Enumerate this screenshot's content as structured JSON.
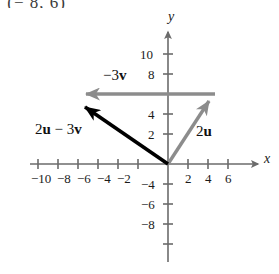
{
  "figure": {
    "cropped_text_above": " (− 8, 6)",
    "axes": {
      "x_axis_label": "x",
      "y_axis_label": "y",
      "x_ticks": [
        -10,
        -8,
        -6,
        -4,
        -2,
        2,
        4,
        6
      ],
      "x_tick_labels": [
        "−10",
        "−8",
        "−6",
        "−4",
        "−2",
        "2",
        "4",
        "6"
      ],
      "y_ticks": [
        10,
        8,
        4,
        2,
        -4,
        -6,
        -8
      ],
      "y_tick_labels": [
        "10",
        "8",
        "4",
        "2",
        "−4",
        "−6",
        "−8"
      ],
      "origin_px": [
        168,
        164
      ],
      "unit_px": 10,
      "xlim": [
        -11.5,
        8.5
      ],
      "ylim": [
        -9.5,
        11.5
      ]
    },
    "vectors": [
      {
        "name": "2u",
        "label": "2u",
        "label_parts": {
          "scalar": "2",
          "vector": "u"
        },
        "color": "#8c8c8c",
        "start": [
          0,
          0
        ],
        "end": [
          4.7,
          7
        ],
        "label_pos_px": [
          196,
          122
        ]
      },
      {
        "name": "-3v",
        "label": "−3v",
        "label_parts": {
          "scalar": "−3",
          "vector": "v"
        },
        "color": "#8c8c8c",
        "start": [
          4.7,
          7
        ],
        "end": [
          -9.6,
          7
        ],
        "label_pos_px": [
          102,
          70
        ]
      },
      {
        "name": "2u-3v",
        "label": "2u − 3v",
        "label_parts": {
          "first": "2",
          "first_vec": "u",
          "op": " − ",
          "second": "3",
          "second_vec": "v"
        },
        "color": "#000000",
        "start": [
          0,
          0
        ],
        "end": [
          -9.6,
          6.6
        ],
        "label_pos_px": [
          37,
          122
        ]
      }
    ],
    "colors": {
      "axis": "#6b6b6b",
      "gray_vector": "#8c8c8c",
      "black_vector": "#000000",
      "text": "#1a1a1a",
      "background": "#ffffff"
    }
  }
}
